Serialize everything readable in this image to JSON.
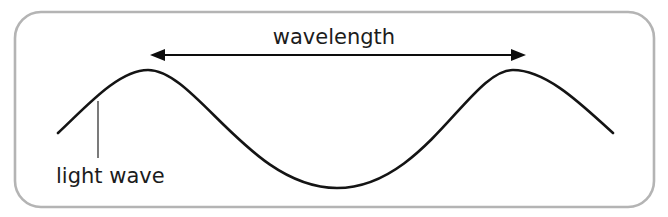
{
  "figure": {
    "background_color": "#ffffff"
  },
  "frame": {
    "name": "rounded-panel",
    "x": 15,
    "y": 12,
    "width": 639,
    "height": 195,
    "corner_radius": 26,
    "stroke_color": "#b4b4b4",
    "fill_color": "#ffffff",
    "stroke_width": 2.6
  },
  "labels": {
    "wavelength": "wavelength",
    "light_wave": "light wave"
  },
  "wavelength_label": {
    "name": "wavelength-label",
    "text": "wavelength",
    "x": 334,
    "y": 44,
    "font_size": 21,
    "color": "#1c1c1c",
    "anchor": "middle"
  },
  "light_wave_label": {
    "name": "light-wave-label",
    "text": "light wave",
    "x": 56,
    "y": 183,
    "font_size": 21,
    "color": "#1c1c1c",
    "anchor": "start"
  },
  "dimension_arrow": {
    "name": "wavelength-dimension-arrow",
    "y": 55,
    "x_start": 150,
    "x_end": 526,
    "color": "#0d0d0d",
    "line_width": 2.1,
    "arrow_head_length": 15,
    "arrow_head_half_height": 6,
    "double_headed": true,
    "measures": "distance between two successive wave crests"
  },
  "leader_line": {
    "name": "light-wave-leader-line",
    "x": 98,
    "y_start": 101,
    "y_end": 158,
    "color": "#333333",
    "line_width": 1.3
  },
  "chart_data": {
    "type": "line",
    "xlabel": "",
    "ylabel": "",
    "grid": false,
    "legend": null,
    "series": [
      {
        "name": "light wave",
        "description": "sinusoidal light wave showing one full wavelength between two crests",
        "stroke_color": "#141414",
        "stroke_width": 2.6,
        "path": "M 58 133 C 85 108, 118 70, 148 70 C 196 70, 250 188, 337 188 C 424 188, 470 70, 513 70 C 548 70, 585 108, 613 133",
        "key_points": [
          {
            "label": "wave start (left end)",
            "x": 58,
            "y": 133
          },
          {
            "label": "first crest (peak)",
            "x": 148,
            "y": 70
          },
          {
            "label": "trough (valley)",
            "x": 337,
            "y": 188
          },
          {
            "label": "second crest (peak)",
            "x": 513,
            "y": 70
          },
          {
            "label": "wave end (right end)",
            "x": 613,
            "y": 133
          }
        ],
        "crest_y": 70,
        "trough_y": 188,
        "wavelength_pixels": 365,
        "amplitude_pixels": 59
      }
    ],
    "annotations": [
      {
        "name": "wavelength",
        "text": "wavelength",
        "type": "double-arrow-dimension",
        "from_x": 150,
        "to_x": 526,
        "y": 55
      },
      {
        "name": "light wave",
        "text": "light wave",
        "type": "leader-callout",
        "points_to_x": 98,
        "points_to_y": 101
      }
    ]
  }
}
